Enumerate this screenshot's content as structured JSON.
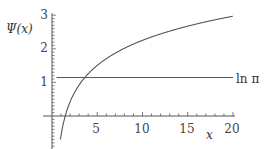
{
  "chart_data": {
    "type": "line",
    "title": "",
    "xlabel": "x",
    "ylabel": "Ψ(x)",
    "xlim": [
      0,
      20
    ],
    "ylim": [
      -1,
      3
    ],
    "x_ticks": [
      "5",
      "10",
      "15",
      "20"
    ],
    "y_ticks": [
      "1",
      "2",
      "3"
    ],
    "grid": false,
    "legend": null,
    "series": [
      {
        "name": "Ψ(x)",
        "x": [
          1.0,
          1.5,
          2,
          2.5,
          3,
          4,
          5,
          6,
          8,
          10,
          12,
          15,
          18,
          20
        ],
        "values": [
          -0.577,
          0.036,
          0.423,
          0.703,
          0.923,
          1.256,
          1.506,
          1.706,
          2.016,
          2.252,
          2.442,
          2.674,
          2.862,
          2.971
        ]
      },
      {
        "name": "ln π",
        "x": [
          0.5,
          20
        ],
        "values": [
          1.1447,
          1.1447
        ]
      }
    ],
    "annotations": [
      {
        "text": "ln π",
        "x": 20,
        "y": 1.1447
      }
    ]
  },
  "labels": {
    "ylabel": "Ψ(x)",
    "xlabel": "x",
    "hline": "ln π",
    "xt5": "5",
    "xt10": "10",
    "xt15": "15",
    "xt20": "20",
    "yt1": "1",
    "yt2": "2",
    "yt3": "3"
  }
}
